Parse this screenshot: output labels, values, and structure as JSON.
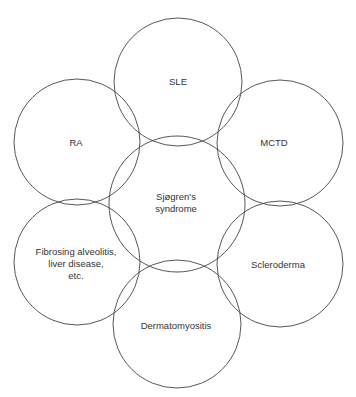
{
  "diagram": {
    "stroke_color": "#444444",
    "circles": [
      {
        "id": "sle",
        "label": "SLE",
        "cx": 178,
        "cy": 82,
        "r": 64
      },
      {
        "id": "ra",
        "label": "RA",
        "cx": 77,
        "cy": 142,
        "r": 63
      },
      {
        "id": "mctd",
        "label": "MCTD",
        "cx": 280,
        "cy": 143,
        "r": 63
      },
      {
        "id": "sjogren",
        "label": "Sjøgren's\nsyndrome",
        "cx": 177,
        "cy": 204,
        "r": 68
      },
      {
        "id": "fibrosing",
        "label": "Fibrosing alveolitis,\nliver disease,\netc.",
        "cx": 77,
        "cy": 262,
        "r": 63
      },
      {
        "id": "scleroderma",
        "label": "Scleroderma",
        "cx": 280,
        "cy": 264,
        "r": 63
      },
      {
        "id": "dermatomyositis",
        "label": "Dermatomyositis",
        "cx": 177,
        "cy": 324,
        "r": 64
      }
    ],
    "labels": {
      "sle": "SLE",
      "ra": "RA",
      "mctd": "MCTD",
      "sjogren_1": "Sjøgren's",
      "sjogren_2": "syndrome",
      "fibrosing_1": "Fibrosing alveolitis,",
      "fibrosing_2": "liver disease,",
      "fibrosing_3": "etc.",
      "scleroderma": "Scleroderma",
      "dermatomyositis": "Dermatomyositis"
    }
  }
}
